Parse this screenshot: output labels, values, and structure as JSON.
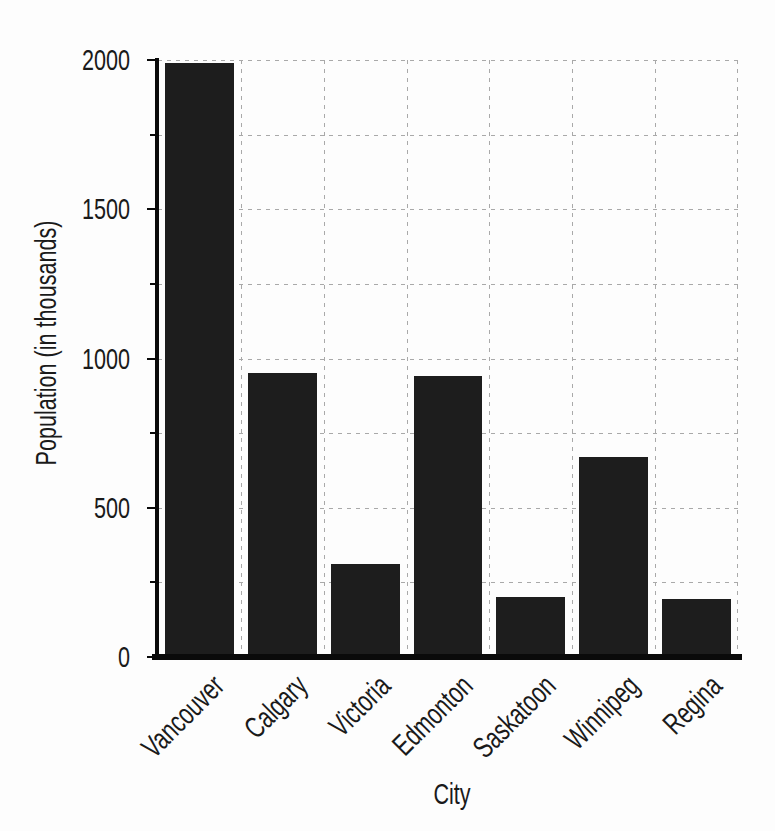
{
  "chart_data": {
    "type": "bar",
    "title": "",
    "xlabel": "City",
    "ylabel": "Population (in thousands)",
    "categories": [
      "Vancouver",
      "Calgary",
      "Victoria",
      "Edmonton",
      "Saskatoon",
      "Winnipeg",
      "Regina"
    ],
    "values": [
      1990,
      950,
      310,
      940,
      200,
      670,
      195
    ],
    "ylim": [
      0,
      2000
    ],
    "ytick_labels": [
      "0",
      "500",
      "1000",
      "1500",
      "2000"
    ],
    "ytick_labeled_interval": 500,
    "ytick_minor_interval": 250,
    "grid": "dashed, horizontal every 250 and vertical between bars",
    "legend_position": "none",
    "bar_color_hex": "#1d1d1d",
    "grid_color_hex": "#a9a9a9",
    "axis_color_hex": "#0a0a0a",
    "text_color_hex": "#1a1a1a",
    "background_hex": "#fdfdfd"
  }
}
